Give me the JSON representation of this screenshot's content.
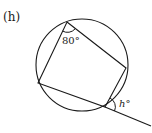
{
  "figure": {
    "part_label": "(h)",
    "angle_label_top": "80°",
    "angle_label_exterior": "h°",
    "stroke_color": "#1a1a1a",
    "circle": {
      "cx": 82,
      "cy": 65,
      "r": 46
    },
    "vertices": {
      "top": [
        67,
        22
      ],
      "right": [
        126,
        68
      ],
      "bottom": [
        105,
        107
      ],
      "left": [
        38,
        83
      ]
    },
    "extended_line_end": [
      151,
      126
    ]
  }
}
